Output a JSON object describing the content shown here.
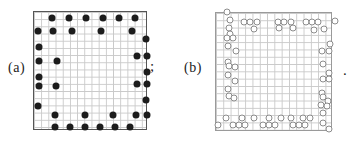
{
  "figure": {
    "separator_semicolon": ";",
    "terminator_period": ".",
    "colors": {
      "background": "#ffffff",
      "grid_line": "#c9c9c9",
      "panel_a_border": "#555555",
      "panel_b_border": "#9a9a9a",
      "filled_dot": "#1c1c1c",
      "open_circle_stroke": "#8c8c8c",
      "open_circle_fill": "#ffffff"
    },
    "panels": [
      {
        "id": "a",
        "label": "(a)",
        "marker": "filled",
        "marker_name": "filled-dot",
        "box": {
          "left": 33,
          "top": 11,
          "width": 114,
          "height": 119
        },
        "grid_cell": 7.2,
        "dots": [
          [
            18,
            6
          ],
          [
            35,
            6
          ],
          [
            52,
            6
          ],
          [
            69,
            6
          ],
          [
            85,
            6
          ],
          [
            101,
            6
          ],
          [
            4,
            19
          ],
          [
            19,
            19
          ],
          [
            38,
            19
          ],
          [
            67,
            19
          ],
          [
            98,
            19
          ],
          [
            112,
            27
          ],
          [
            5,
            35
          ],
          [
            103,
            44
          ],
          [
            113,
            44
          ],
          [
            5,
            49
          ],
          [
            23,
            49
          ],
          [
            113,
            60
          ],
          [
            5,
            65
          ],
          [
            103,
            72
          ],
          [
            113,
            72
          ],
          [
            5,
            74
          ],
          [
            22,
            74
          ],
          [
            112,
            88
          ],
          [
            4,
            94
          ],
          [
            21,
            103
          ],
          [
            51,
            103
          ],
          [
            79,
            103
          ],
          [
            102,
            103
          ],
          [
            113,
            103
          ],
          [
            21,
            115
          ],
          [
            36,
            115
          ],
          [
            51,
            115
          ],
          [
            66,
            115
          ],
          [
            81,
            115
          ],
          [
            96,
            115
          ]
        ]
      },
      {
        "id": "b",
        "label": "(b)",
        "marker": "open",
        "marker_name": "open-circle",
        "box": {
          "left": 215,
          "top": 12,
          "width": 117,
          "height": 119
        },
        "grid_cell": 7.3,
        "dots": [
          [
            11,
            -1
          ],
          [
            14,
            7
          ],
          [
            13,
            15
          ],
          [
            14,
            21
          ],
          [
            11,
            25
          ],
          [
            17,
            25
          ],
          [
            12,
            33
          ],
          [
            20,
            38
          ],
          [
            12,
            49
          ],
          [
            13,
            53
          ],
          [
            19,
            54
          ],
          [
            12,
            62
          ],
          [
            19,
            68
          ],
          [
            12,
            76
          ],
          [
            13,
            83
          ],
          [
            18,
            85
          ],
          [
            28,
            9
          ],
          [
            34,
            9
          ],
          [
            41,
            9
          ],
          [
            62,
            9
          ],
          [
            68,
            9
          ],
          [
            75,
            9
          ],
          [
            90,
            9
          ],
          [
            96,
            9
          ],
          [
            102,
            9
          ],
          [
            119,
            8
          ],
          [
            38,
            16
          ],
          [
            63,
            15
          ],
          [
            77,
            15
          ],
          [
            98,
            17
          ],
          [
            108,
            16
          ],
          [
            114,
            31
          ],
          [
            106,
            38
          ],
          [
            113,
            38
          ],
          [
            107,
            51
          ],
          [
            113,
            60
          ],
          [
            107,
            66
          ],
          [
            113,
            66
          ],
          [
            106,
            80
          ],
          [
            107,
            84
          ],
          [
            112,
            88
          ],
          [
            105,
            92
          ],
          [
            111,
            93
          ],
          [
            107,
            100
          ],
          [
            107,
            110
          ],
          [
            113,
            116
          ],
          [
            10,
            105
          ],
          [
            26,
            105
          ],
          [
            38,
            105
          ],
          [
            53,
            105
          ],
          [
            65,
            105
          ],
          [
            75,
            105
          ],
          [
            87,
            105
          ],
          [
            94,
            105
          ],
          [
            2,
            112
          ],
          [
            17,
            112
          ],
          [
            23,
            112
          ],
          [
            29,
            112
          ],
          [
            47,
            112
          ],
          [
            53,
            112
          ],
          [
            59,
            112
          ],
          [
            77,
            112
          ],
          [
            83,
            112
          ],
          [
            89,
            112
          ]
        ]
      }
    ]
  }
}
